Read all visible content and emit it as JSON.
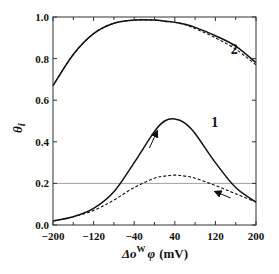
{
  "chart_data": {
    "type": "line",
    "title": "",
    "xlabel": "Δo^W φ (mV)",
    "xlabel_parts": {
      "delta": "Δo",
      "sup": "W",
      "phi": "φ",
      "unit": "(mV)"
    },
    "ylabel": "θi",
    "ylabel_parts": {
      "main": "θ",
      "sub": "i"
    },
    "xlim": [
      -200,
      200
    ],
    "ylim": [
      0.0,
      1.0
    ],
    "x_ticks": [
      -200,
      -120,
      -40,
      40,
      120,
      200
    ],
    "x_tick_labels": [
      "−200",
      "−120",
      "−40",
      "40",
      "120",
      "200"
    ],
    "y_ticks": [
      0.0,
      0.2,
      0.4,
      0.6,
      0.8,
      1.0
    ],
    "y_tick_labels": [
      "0.0",
      "0.2",
      "0.4",
      "0.6",
      "0.8",
      "1.0"
    ],
    "grid": false,
    "reference_line": {
      "y": 0.2,
      "style": "thin gray horizontal"
    },
    "annotations": [
      {
        "text": "1",
        "x": 112,
        "y": 0.47
      },
      {
        "text": "2",
        "x": 150,
        "y": 0.82
      },
      {
        "type": "arrow",
        "direction": "up-right",
        "from": [
          -10,
          0.37
        ],
        "to": [
          5,
          0.45
        ]
      },
      {
        "type": "arrow",
        "direction": "left",
        "from": [
          150,
          0.13
        ],
        "to": [
          120,
          0.16
        ]
      }
    ],
    "x": [
      -200,
      -160,
      -120,
      -80,
      -40,
      0,
      20,
      40,
      60,
      80,
      120,
      160,
      200
    ],
    "series": [
      {
        "name": "Curve 1 forward (solid)",
        "style": "solid",
        "values": [
          0.02,
          0.04,
          0.08,
          0.16,
          0.3,
          0.45,
          0.5,
          0.51,
          0.49,
          0.44,
          0.3,
          0.18,
          0.11
        ]
      },
      {
        "name": "Curve 1 reverse (dashed)",
        "style": "dashed",
        "values": [
          0.02,
          0.04,
          0.07,
          0.12,
          0.18,
          0.225,
          0.235,
          0.24,
          0.235,
          0.225,
          0.19,
          0.15,
          0.11
        ]
      },
      {
        "name": "Curve 2 forward (solid)",
        "style": "solid",
        "values": [
          0.67,
          0.82,
          0.92,
          0.97,
          0.985,
          0.985,
          0.98,
          0.975,
          0.965,
          0.95,
          0.91,
          0.86,
          0.78
        ]
      },
      {
        "name": "Curve 2 reverse (dashed)",
        "style": "dashed",
        "values": [
          0.67,
          0.82,
          0.92,
          0.97,
          0.985,
          0.985,
          0.98,
          0.975,
          0.963,
          0.945,
          0.9,
          0.845,
          0.77
        ]
      }
    ]
  },
  "colors": {
    "line": "#111111",
    "frame": "#333333",
    "refline": "#888888",
    "background": "#ffffff"
  }
}
